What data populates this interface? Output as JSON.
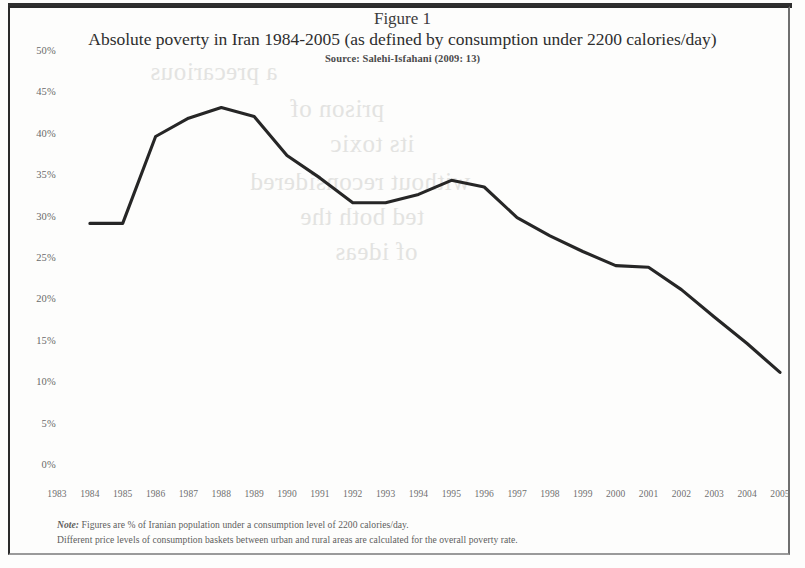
{
  "figure": {
    "label": "Figure 1",
    "title": "Absolute poverty in Iran 1984-2005 (as defined by consumption under 2200 calories/day)",
    "source": "Source: Salehi-Isfahani (2009: 13)"
  },
  "notes": {
    "note1_prefix": "Note:",
    "note1": " Figures are % of Iranian population under a consumption level of 2200 calories/day.",
    "note2": "Different price levels of consumption baskets between urban and rural areas are calculated for the overall poverty rate."
  },
  "colors": {
    "line": "#262626",
    "frame": "#2a2a2a",
    "tick_text": "#6a6a6a",
    "title_text": "#2e2e2e",
    "page_background": "#fdfdfc"
  },
  "bleed_text": [
    "a precarious",
    "prison of",
    "its toxic",
    "without reconsidered",
    "ted both the",
    "of ideas"
  ],
  "chart_data": {
    "type": "line",
    "title": "Absolute poverty in Iran 1984-2005 (as defined by consumption under 2200 calories/day)",
    "subtitle": "Figure 1",
    "source": "Source: Salehi-Isfahani (2009: 13)",
    "xlabel": "",
    "ylabel": "",
    "grid": false,
    "legend": false,
    "xlim": [
      1983,
      2005
    ],
    "ylim": [
      0,
      50
    ],
    "ytick_labels": [
      "50%",
      "45%",
      "40%",
      "35%",
      "30%",
      "25%",
      "20%",
      "15%",
      "10%",
      "5%",
      "0%"
    ],
    "ytick_values": [
      50,
      45,
      40,
      35,
      30,
      25,
      20,
      15,
      10,
      5,
      0
    ],
    "xtick_labels": [
      "1983",
      "1984",
      "1985",
      "1986",
      "1987",
      "1988",
      "1989",
      "1990",
      "1991",
      "1992",
      "1993",
      "1994",
      "1995",
      "1996",
      "1997",
      "1998",
      "1999",
      "2000",
      "2001",
      "2002",
      "2003",
      "2004",
      "2005"
    ],
    "x": [
      1984,
      1985,
      1986,
      1987,
      1988,
      1989,
      1990,
      1991,
      1992,
      1993,
      1994,
      1995,
      1996,
      1997,
      1998,
      1999,
      2000,
      2001,
      2002,
      2003,
      2004,
      2005
    ],
    "series": [
      {
        "name": "Absolute poverty rate",
        "unit": "%",
        "values": [
          29.3,
          29.3,
          39.8,
          42.0,
          43.3,
          42.2,
          37.5,
          34.8,
          31.8,
          31.8,
          32.8,
          34.5,
          33.7,
          30.0,
          27.8,
          25.9,
          24.2,
          24.0,
          21.3,
          18.0,
          14.8,
          11.3
        ]
      }
    ]
  }
}
